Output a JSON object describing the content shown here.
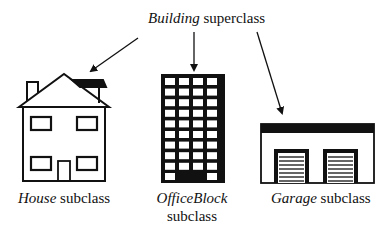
{
  "superclass": {
    "name": "Building",
    "suffix": "superclass"
  },
  "subclasses": [
    {
      "name": "House",
      "suffix": "subclass"
    },
    {
      "name": "OfficeBlock",
      "suffix": "subclass"
    },
    {
      "name": "Garage",
      "suffix": "subclass"
    }
  ]
}
